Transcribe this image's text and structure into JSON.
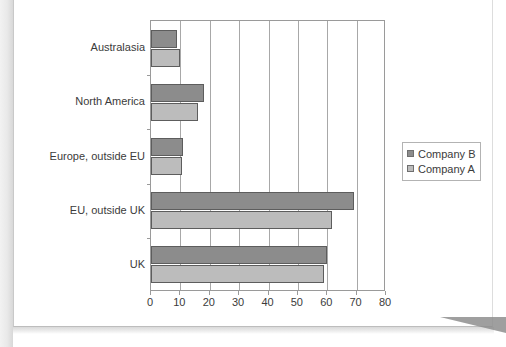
{
  "chart_data": {
    "type": "bar",
    "orientation": "horizontal",
    "title": "",
    "subtitle": "",
    "xlabel": "",
    "ylabel": "",
    "xlim": [
      0,
      80
    ],
    "xticks": [
      0,
      10,
      20,
      30,
      40,
      50,
      60,
      70,
      80
    ],
    "xtick_labels": [
      "0",
      "10",
      "20",
      "30",
      "40",
      "50",
      "60",
      "70",
      "80"
    ],
    "grid": "vertical",
    "categories": [
      "Australasia",
      "North America",
      "Europe, outside EU",
      "EU, outside UK",
      "UK"
    ],
    "series": [
      {
        "name": "Company B",
        "color": "#8c8c8c",
        "values": [
          9,
          18,
          11,
          69,
          60
        ]
      },
      {
        "name": "Company A",
        "color": "#bcbcbc",
        "values": [
          10,
          16,
          10.5,
          61.5,
          59
        ]
      }
    ],
    "legend": {
      "position": "right",
      "entries": [
        {
          "label": "Company B",
          "swatch": "legend-swatch-company-b",
          "color": "#8c8c8c"
        },
        {
          "label": "Company A",
          "swatch": "legend-swatch-company-a",
          "color": "#bcbcbc"
        }
      ]
    },
    "annotations": []
  }
}
